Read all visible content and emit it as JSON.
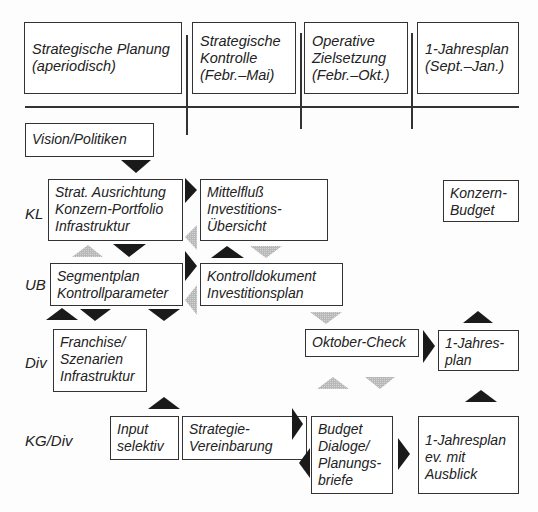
{
  "header": {
    "columns": [
      {
        "label": "Strategische Planung\n(aperiodisch)"
      },
      {
        "label": "Strategische\nKontrolle\n(Febr.–Mai)"
      },
      {
        "label": "Operative\nZielsetzung\n(Febr.–Okt.)"
      },
      {
        "label": "1-Jahresplan\n(Sept.–Jan.)"
      }
    ]
  },
  "rows": {
    "kl": "KL",
    "ub": "UB",
    "div": "Div",
    "kgdiv": "KG/Div"
  },
  "boxes": {
    "vision": "Vision/Politiken",
    "strat": "Strat. Ausrichtung\nKonzern-Portfolio\nInfrastruktur",
    "mittelfluss": "Mittelfluß\nInvestitions-\nÜbersicht",
    "konzern_budget": "Konzern-\nBudget",
    "segmentplan": "Segmentplan\nKontrollparameter",
    "kontrolldokument": "Kontrolldokument\nInvestitionsplan",
    "franchise": "Franchise/\nSzenarien\nInfrastruktur",
    "oktober_check": "Oktober-Check",
    "jahresplan_small": "1-Jahres-\nplan",
    "input": "Input\nselektiv",
    "strategie_vereinbarung": "Strategie-\nVereinbarung",
    "budget": "Budget\nDialoge/\nPlanungs-\nbriefe",
    "jahresplan_ausblick": "1-Jahresplan\nev. mit\nAusblick"
  },
  "colors": {
    "arrow_black": "#1a1a1a",
    "arrow_grey": "#b3b3b3",
    "border": "#333333"
  }
}
